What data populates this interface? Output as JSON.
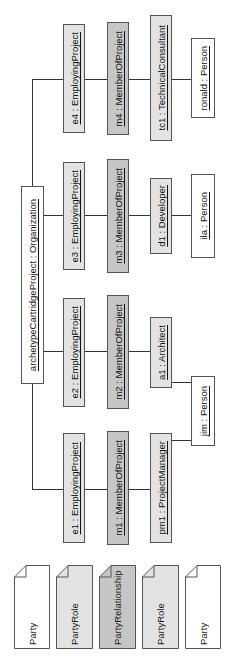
{
  "diagram": {
    "type": "UML object diagram (rotated 90°)",
    "organization": {
      "label": "archetypeCartridgeProject : Organization",
      "instance": "archetypeCartridgeProject",
      "class": "Organization"
    },
    "columns": [
      {
        "employing": {
          "label": "e4 : EmployingProject"
        },
        "member": {
          "label": "m4 : MemberOfProject"
        },
        "role": {
          "label": "tc1 : TechnicalConsultant"
        },
        "person": {
          "label": "ronald : Person"
        }
      },
      {
        "employing": {
          "label": "e3 : EmployingProject"
        },
        "member": {
          "label": "m3 : MemberOfProject"
        },
        "role": {
          "label": "d1 : Developer"
        },
        "person": {
          "label": "ila : Person"
        }
      },
      {
        "employing": {
          "label": "e2 : EmployingProject"
        },
        "member": {
          "label": "m2 : MemberOfProject"
        },
        "role": {
          "label": "a1 : Architect"
        }
      },
      {
        "employing": {
          "label": "e1 : EmployingProject"
        },
        "member": {
          "label": "m1 : MemberOfProject"
        },
        "role": {
          "label": "pm1 : ProjectManager"
        }
      }
    ],
    "shared_person": {
      "label": "jim : Person",
      "linked_roles": [
        "a1",
        "pm1"
      ]
    },
    "legend": [
      {
        "label": "Party",
        "fill": "#ffffff"
      },
      {
        "label": "PartyRole",
        "fill": "#e3e3e3"
      },
      {
        "label": "PartyRelationship",
        "fill": "#c6c6c6"
      },
      {
        "label": "PartyRole",
        "fill": "#e3e3e3"
      },
      {
        "label": "Party",
        "fill": "#ffffff"
      }
    ],
    "colors": {
      "party": "#ffffff",
      "party_role": "#e3e3e3",
      "party_relationship": "#c6c6c6",
      "line": "#333333",
      "border": "#555555"
    }
  }
}
